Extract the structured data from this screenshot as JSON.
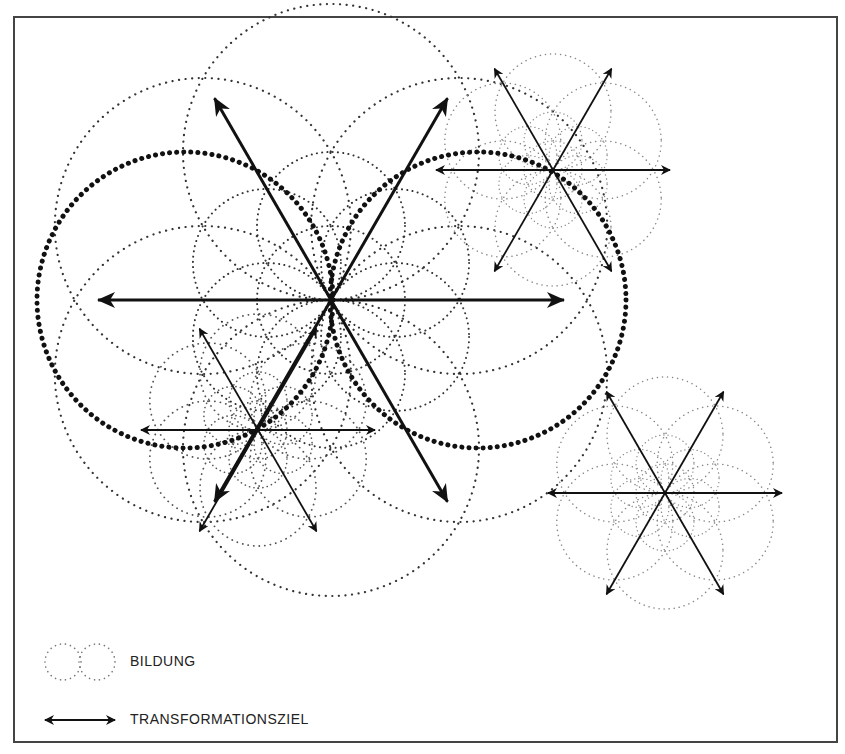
{
  "diagram": {
    "frame": {
      "x": 14,
      "y": 17,
      "width": 823,
      "height": 725,
      "stroke": "#444444"
    },
    "colors": {
      "ink": "#111111",
      "faint_dots": "#555555",
      "light_dots": "#999999"
    },
    "clusters": [
      {
        "id": "main",
        "cx": 331,
        "cy": 300,
        "r": 148,
        "arrow_len": 233,
        "weight": "heavy"
      },
      {
        "id": "upper-right",
        "cx": 553,
        "cy": 170,
        "r": 58,
        "arrow_len": 117,
        "weight": "light"
      },
      {
        "id": "lower-left",
        "cx": 258,
        "cy": 430,
        "r": 58,
        "arrow_len": 117,
        "weight": "medium"
      },
      {
        "id": "lower-right",
        "cx": 665,
        "cy": 493,
        "r": 58,
        "arrow_len": 117,
        "weight": "light"
      }
    ],
    "bold_circles": [
      {
        "cx": 185,
        "cy": 300,
        "r": 148
      },
      {
        "cx": 478,
        "cy": 300,
        "r": 148
      }
    ]
  },
  "legend": {
    "items": [
      {
        "symbol": "dotted-circles",
        "label": "BILDUNG"
      },
      {
        "symbol": "double-arrow",
        "label": "TRANSFORMATIONSZIEL"
      }
    ]
  }
}
